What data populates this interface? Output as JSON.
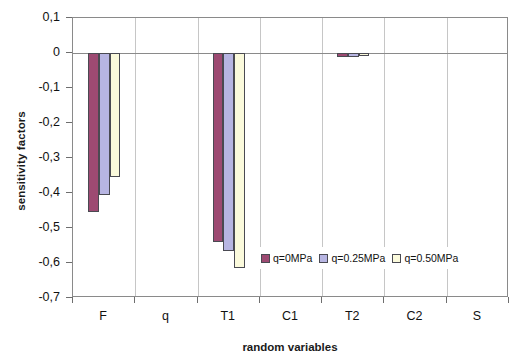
{
  "chart_data": {
    "type": "bar",
    "title": "",
    "xlabel": "random variables",
    "ylabel": "sensitivity factors",
    "categories": [
      "F",
      "q",
      "T1",
      "C1",
      "T2",
      "C2",
      "S"
    ],
    "series": [
      {
        "name": "q=0MPa",
        "color": "#9d4a72",
        "values": [
          -0.455,
          0.0,
          -0.54,
          0.0,
          -0.01,
          0.0,
          0.0
        ]
      },
      {
        "name": "q=0.25MPa",
        "color": "#b7b5e2",
        "values": [
          -0.405,
          0.0,
          -0.565,
          0.0,
          -0.01,
          0.0,
          0.0
        ]
      },
      {
        "name": "q=0.50MPa",
        "color": "#fbfadc",
        "values": [
          -0.355,
          0.0,
          -0.615,
          0.0,
          -0.008,
          0.0,
          0.0
        ]
      }
    ],
    "ylim": [
      -0.7,
      0.1
    ],
    "yticks": [
      0.1,
      0,
      -0.1,
      -0.2,
      -0.3,
      -0.4,
      -0.5,
      -0.6,
      -0.7
    ],
    "ytick_labels": [
      "0,1",
      "0",
      "-0,1",
      "-0,2",
      "-0,3",
      "-0,4",
      "-0,5",
      "-0,6",
      "-0,7"
    ],
    "grid": "vertical-category-separators",
    "legend_position": "inside-bottom-center",
    "zero_line": true
  },
  "axes": {
    "y_title": "sensitivity factors",
    "x_title": "random variables"
  }
}
